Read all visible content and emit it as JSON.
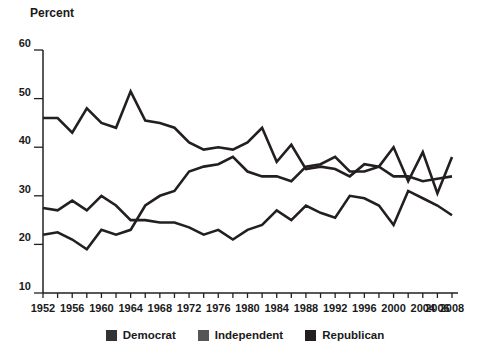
{
  "chart_data": {
    "type": "line",
    "title": "",
    "ylabel": "Percent",
    "xlabel": "",
    "ylim": [
      10,
      60
    ],
    "ytick_labels": [
      "60",
      "50",
      "40",
      "30",
      "20",
      "10"
    ],
    "ytick_values": [
      60,
      50,
      40,
      30,
      20,
      10
    ],
    "grid": false,
    "legend_position": "bottom-center",
    "x": [
      1952,
      1954,
      1956,
      1958,
      1960,
      1962,
      1964,
      1966,
      1968,
      1970,
      1972,
      1974,
      1976,
      1978,
      1980,
      1982,
      1984,
      1986,
      1988,
      1990,
      1992,
      1994,
      1996,
      1998,
      2000,
      2002,
      2004,
      2006,
      2008
    ],
    "xtick_labels": [
      "1952",
      "1956",
      "1960",
      "1964",
      "1968",
      "1972",
      "1976",
      "1980",
      "1984",
      "1988",
      "1992",
      "1996",
      "2000",
      "2004",
      "2006",
      "2008"
    ],
    "xtick_values": [
      1952,
      1956,
      1960,
      1964,
      1968,
      1972,
      1976,
      1980,
      1984,
      1988,
      1992,
      1996,
      2000,
      2004,
      2006,
      2008
    ],
    "minor_tick_interval": 2,
    "series": [
      {
        "name": "Democrat",
        "color": "#231f20",
        "values": [
          46.0,
          46.0,
          43.0,
          48.0,
          45.0,
          44.0,
          51.5,
          45.5,
          45.0,
          44.0,
          41.0,
          39.5,
          40.0,
          39.5,
          41.0,
          44.0,
          37.0,
          40.5,
          35.5,
          36.0,
          35.5,
          34.0,
          36.5,
          36.0,
          34.0,
          34.0,
          33.0,
          33.5,
          34.0
        ]
      },
      {
        "name": "Independent",
        "color": "#231f20",
        "values": [
          22.0,
          22.5,
          21.0,
          19.0,
          23.0,
          22.0,
          23.0,
          28.0,
          30.0,
          31.0,
          35.0,
          36.0,
          36.5,
          38.0,
          35.0,
          34.0,
          34.0,
          33.0,
          36.0,
          36.5,
          38.0,
          35.0,
          35.0,
          36.0,
          40.0,
          33.0,
          39.0,
          30.5,
          38.0
        ]
      },
      {
        "name": "Republican",
        "color": "#231f20",
        "values": [
          27.5,
          27.0,
          29.0,
          27.0,
          30.0,
          28.0,
          25.0,
          25.0,
          24.5,
          24.5,
          23.5,
          22.0,
          23.0,
          21.0,
          23.0,
          24.0,
          27.0,
          25.0,
          28.0,
          26.5,
          25.5,
          30.0,
          29.5,
          28.0,
          24.0,
          31.0,
          29.5,
          28.0,
          26.0
        ]
      }
    ]
  },
  "legend": {
    "items": [
      {
        "label": "Democrat",
        "color": "#333333"
      },
      {
        "label": "Independent",
        "color": "#555555"
      },
      {
        "label": "Republican",
        "color": "#231f20"
      }
    ]
  }
}
